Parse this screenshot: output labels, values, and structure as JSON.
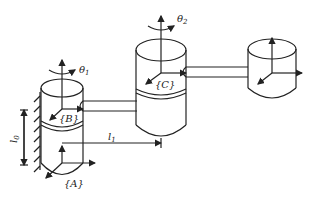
{
  "diagram": {
    "type": "robot-arm-kinematics",
    "frames": [
      {
        "id": "A",
        "label": "{A}"
      },
      {
        "id": "B",
        "label": "{B}"
      },
      {
        "id": "C",
        "label": "{C}"
      }
    ],
    "joint_angles": [
      {
        "id": "theta1",
        "label": "θ",
        "sub": "1"
      },
      {
        "id": "theta2",
        "label": "θ",
        "sub": "2"
      }
    ],
    "dimensions": [
      {
        "id": "l0",
        "label": "l",
        "sub": "0"
      },
      {
        "id": "l1",
        "label": "l",
        "sub": "1"
      }
    ]
  },
  "labels": {
    "frame_a": "{A}",
    "frame_b": "{B}",
    "frame_c": "{C}",
    "theta1": "θ",
    "theta1_sub": "1",
    "theta2": "θ",
    "theta2_sub": "2",
    "l0": "l",
    "l0_sub": "0",
    "l1": "l",
    "l1_sub": "1"
  }
}
